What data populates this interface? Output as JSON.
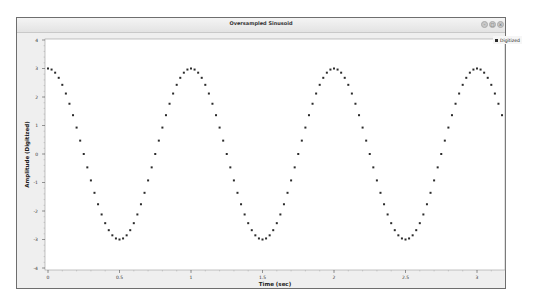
{
  "window": {
    "title": "Oversampled Sinusoid",
    "buttons": [
      "minimize",
      "maximize",
      "close"
    ]
  },
  "legend": {
    "label": "Digitized",
    "color": "#2b2b2b"
  },
  "chart_data": {
    "type": "scatter",
    "title": "Oversampled Sinusoid",
    "xlabel": "Time (sec)",
    "ylabel": "Amplitude (Digitized)",
    "xlim": [
      0,
      3.2
    ],
    "ylim": [
      -4,
      4
    ],
    "xticks": [
      0,
      0.5,
      1,
      1.5,
      2,
      2.5,
      3
    ],
    "xtick_labels": [
      "0",
      "0.5",
      "1",
      "1.5",
      "2",
      "2.5",
      "3"
    ],
    "yticks": [
      4,
      3,
      2,
      1,
      0,
      -1,
      -2,
      -3,
      -4
    ],
    "ytick_labels": [
      "4",
      "3",
      "2",
      "1",
      "0",
      "-1",
      "-2",
      "-3",
      "-4"
    ],
    "grid": false,
    "legend_position": "outside-top-right",
    "series": [
      {
        "name": "Digitized",
        "function": "3*cos(2*pi*1.0*t)",
        "amplitude": 3,
        "frequency_hz": 1.0,
        "sample_interval": 0.025,
        "t_start": 0,
        "t_end": 3.175
      }
    ]
  }
}
